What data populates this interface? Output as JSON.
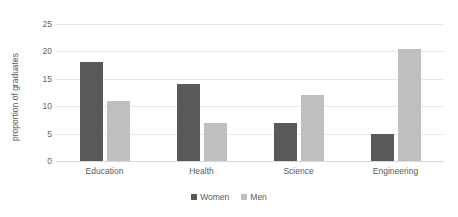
{
  "chart_data": {
    "type": "bar",
    "title": "",
    "xlabel": "",
    "ylabel": "proportion of graduates",
    "categories": [
      "Education",
      "Health",
      "Science",
      "Engineering"
    ],
    "series": [
      {
        "name": "Women",
        "values": [
          18,
          14,
          7,
          5
        ],
        "color": "#595959"
      },
      {
        "name": "Men",
        "values": [
          11,
          7,
          12,
          20.5
        ],
        "color": "#bfbfbf"
      }
    ],
    "ylim": [
      0,
      25
    ],
    "yticks": [
      0,
      5,
      10,
      15,
      20,
      25
    ],
    "ytick_labels": [
      "0",
      "5",
      "10",
      "15",
      "20",
      "25"
    ],
    "grid": true,
    "legend_position": "bottom-center"
  },
  "legend": {
    "items": [
      {
        "label": "Women",
        "color": "#595959"
      },
      {
        "label": "Men",
        "color": "#bfbfbf"
      }
    ]
  },
  "colors": {
    "women": "#595959",
    "men": "#bfbfbf",
    "gridline": "#e8e8e8",
    "text": "#5a5a5a",
    "background": "#ffffff"
  }
}
